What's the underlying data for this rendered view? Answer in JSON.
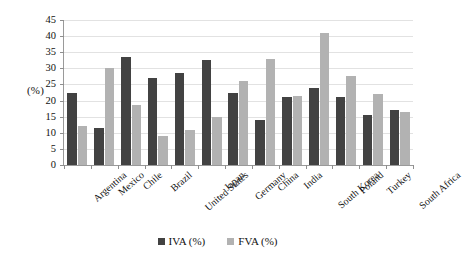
{
  "chart_data": {
    "type": "bar",
    "title": "",
    "xlabel": "",
    "ylabel": "(%)",
    "ylim": [
      0,
      45
    ],
    "ytick_step": 5,
    "yticks": [
      45,
      40,
      35,
      30,
      25,
      20,
      15,
      10,
      5,
      0
    ],
    "grid": true,
    "legend_position": "bottom",
    "categories": [
      "Argentina",
      "Mexico",
      "Chile",
      "Brazil",
      "United States",
      "Japan",
      "Germany",
      "China",
      "India",
      "South Korea",
      "Poland",
      "Turkey",
      "South Africa"
    ],
    "series": [
      {
        "name": "IVA (%)",
        "color": "#424242",
        "values": [
          22.5,
          11.5,
          33.5,
          27.0,
          28.5,
          32.5,
          22.5,
          14.0,
          21.0,
          24.0,
          21.0,
          15.5,
          17.0
        ]
      },
      {
        "name": "FVA (%)",
        "color": "#b2b2b2",
        "values": [
          12.0,
          30.0,
          18.5,
          9.0,
          11.0,
          15.0,
          26.0,
          33.0,
          21.5,
          41.0,
          27.5,
          22.0,
          16.5
        ]
      }
    ]
  },
  "legend": {
    "items": [
      {
        "label": "IVA (%)",
        "color": "#424242"
      },
      {
        "label": "FVA (%)",
        "color": "#b2b2b2"
      }
    ]
  },
  "axis": {
    "y_title": "(%)"
  }
}
